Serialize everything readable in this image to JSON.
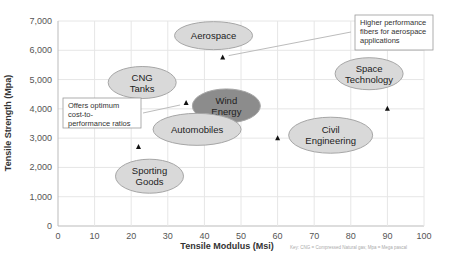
{
  "chart_data": {
    "type": "scatter",
    "title": "",
    "xlabel": "Tensile Modulus (Msi)",
    "ylabel": "Tensile Strength (Mpa)",
    "xlim": [
      0,
      100
    ],
    "ylim": [
      0,
      7000
    ],
    "x_ticks": [
      "0",
      "10",
      "20",
      "30",
      "40",
      "50",
      "60",
      "70",
      "80",
      "90",
      "100"
    ],
    "y_ticks": [
      "0",
      "1,000",
      "2,000",
      "3,000",
      "4,000",
      "5,000",
      "6,000",
      "7,000"
    ],
    "grid": true,
    "points": [
      {
        "x": 22,
        "y": 2700
      },
      {
        "x": 35,
        "y": 4200
      },
      {
        "x": 45,
        "y": 5750
      },
      {
        "x": 60,
        "y": 3000
      },
      {
        "x": 90,
        "y": 4000
      }
    ],
    "application_labels": [
      {
        "lines": [
          "Aerospace"
        ],
        "cx": 42.5,
        "cy": 6500,
        "highlight": false
      },
      {
        "lines": [
          "CNG",
          "Tanks"
        ],
        "cx": 23,
        "cy": 4900,
        "highlight": false
      },
      {
        "lines": [
          "Wind",
          "Energy"
        ],
        "cx": 46,
        "cy": 4100,
        "highlight": true
      },
      {
        "lines": [
          "Automobiles"
        ],
        "cx": 38,
        "cy": 3300,
        "highlight": false
      },
      {
        "lines": [
          "Sporting",
          "Goods"
        ],
        "cx": 25,
        "cy": 1700,
        "highlight": false
      },
      {
        "lines": [
          "Space",
          "Technology"
        ],
        "cx": 85,
        "cy": 5200,
        "highlight": false
      },
      {
        "lines": [
          "Civil",
          "Engineering"
        ],
        "cx": 74.5,
        "cy": 3100,
        "highlight": false
      }
    ],
    "annotations": [
      {
        "text": [
          "Higher performance",
          "fibers for aerospace",
          "applications"
        ]
      },
      {
        "text": [
          "Offers optimum",
          "cost-to-",
          "performance ratios"
        ]
      }
    ],
    "footnote": "Key: CNG = Compressed Natural gas; Mpa = Mega pascal"
  },
  "colors": {
    "ellipse_fill": "#d9d9d9",
    "ellipse_highlight": "#8c8c8c",
    "ellipse_stroke": "#a6a6a6",
    "grid": "#e6e6e6",
    "marker": "#111111"
  }
}
